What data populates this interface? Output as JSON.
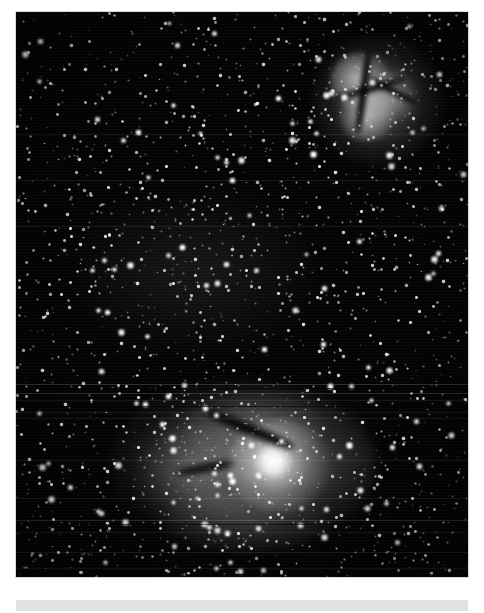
{
  "page": {
    "background_color": "#ffffff",
    "width": 484,
    "height": 613
  },
  "plate": {
    "name": "astronomical-photographic-plate",
    "color_mode": "monochrome",
    "background_color": "#030303",
    "frame": {
      "x": 16,
      "y": 12,
      "width": 452,
      "height": 565
    },
    "artifacts": [
      "horizontal-scan-lines",
      "plate-grain",
      "vignetting"
    ]
  },
  "objects": [
    {
      "id": "trifid-nebula",
      "label": "",
      "position": {
        "x": 362,
        "y": 88
      },
      "size": {
        "width": 132,
        "height": 132
      },
      "morphology": "emission nebula divided by dark dust lanes",
      "brightness": "moderate"
    },
    {
      "id": "lagoon-nebula",
      "label": "",
      "position": {
        "x": 226,
        "y": 453
      },
      "size": {
        "width": 268,
        "height": 170
      },
      "morphology": "bright emission nebula with central dark lane and embedded star cluster",
      "brightness": "high"
    },
    {
      "id": "star-field",
      "label": "",
      "position": {
        "x": 242,
        "y": 294
      },
      "morphology": "dense stellar field",
      "brightness": "varied"
    }
  ],
  "caption_bar": {
    "text": "",
    "background_color": "#e2e2e2"
  }
}
